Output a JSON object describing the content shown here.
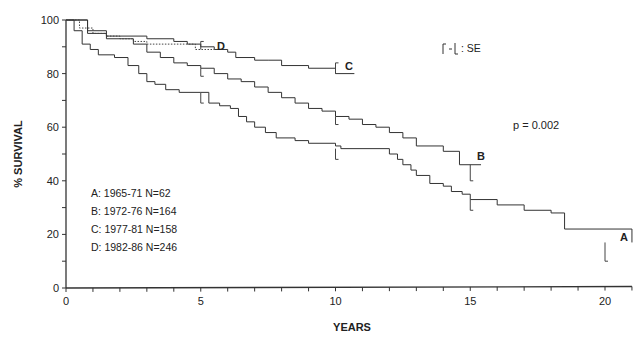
{
  "chart_data": {
    "type": "line",
    "subtype": "kaplan-meier step survival curves",
    "title": "",
    "xlabel": "YEARS",
    "ylabel": "% SURVIVAL",
    "xlim": [
      0,
      21
    ],
    "ylim": [
      0,
      100
    ],
    "xticks": [
      0,
      5,
      10,
      15,
      20
    ],
    "yticks": [
      0,
      20,
      40,
      60,
      80,
      100
    ],
    "grid": false,
    "legend_position": "inside lower-left",
    "legend": [
      "A: 1965-71 N=62",
      "B: 1972-76 N=164",
      "C: 1977-81 N=158",
      "D: 1982-86 N=246"
    ],
    "annotations": {
      "se_key": ": SE",
      "p_value": "p = 0.002"
    },
    "series": [
      {
        "name": "A",
        "label": "A: 1965-71 N=62",
        "style": "solid",
        "x": [
          0,
          0.3,
          0.6,
          0.9,
          1.2,
          1.8,
          2.3,
          2.7,
          3.0,
          3.3,
          3.7,
          4.2,
          5.0,
          5.3,
          5.7,
          6.1,
          6.4,
          6.7,
          7.0,
          7.4,
          7.8,
          8.5,
          9.0,
          10.0,
          10.2,
          11.8,
          12.0,
          12.3,
          12.5,
          12.8,
          13.0,
          13.5,
          14.0,
          14.3,
          14.7,
          15.0,
          16.0,
          17.0,
          18.0,
          18.5,
          21.0
        ],
        "y": [
          100,
          96,
          91,
          89,
          87,
          86,
          83,
          80,
          77,
          76,
          74,
          73,
          73,
          69,
          68,
          67,
          64,
          62,
          60,
          58,
          56,
          55,
          54,
          53,
          52,
          52,
          50,
          48,
          46,
          44,
          42,
          39,
          38,
          36,
          35,
          33,
          31,
          29,
          28,
          22,
          17
        ],
        "se_marks": [
          [
            5,
            73,
            69
          ],
          [
            10,
            52,
            48
          ],
          [
            15,
            33,
            29
          ],
          [
            20,
            17,
            10
          ]
        ],
        "end_label": "A"
      },
      {
        "name": "B",
        "label": "B: 1972-76 N=164",
        "style": "solid",
        "x": [
          0,
          0.8,
          1.5,
          2.5,
          3.0,
          3.5,
          4.0,
          4.5,
          5.0,
          5.5,
          6.0,
          6.5,
          7.0,
          7.5,
          8.0,
          8.5,
          9.0,
          9.5,
          10.0,
          10.5,
          11.0,
          11.5,
          12.0,
          12.5,
          13.0,
          14.0,
          14.6,
          15.4
        ],
        "y": [
          100,
          95,
          93,
          91,
          88,
          86,
          84,
          83,
          82,
          80,
          78,
          77,
          75,
          73,
          71,
          69,
          67,
          66,
          64,
          63,
          61,
          60,
          58,
          56,
          53,
          51,
          46,
          46
        ],
        "se_marks": [
          [
            5,
            82,
            79
          ],
          [
            10,
            64,
            61
          ],
          [
            15,
            46,
            40
          ]
        ],
        "end_label": "B"
      },
      {
        "name": "C",
        "label": "C: 1977-81 N=158",
        "style": "solid",
        "x": [
          0,
          0.8,
          1.5,
          2.0,
          3.0,
          4.0,
          4.5,
          5.0,
          5.5,
          6.0,
          6.3,
          7.0,
          7.5,
          8.0,
          9.0,
          10.0,
          10.7
        ],
        "y": [
          100,
          96,
          94,
          94,
          93,
          92,
          91,
          90,
          89,
          88,
          86,
          85,
          85,
          83,
          82,
          80,
          80
        ],
        "se_marks": [
          [
            10,
            80,
            84
          ]
        ],
        "end_label": "C"
      },
      {
        "name": "D",
        "label": "D: 1982-86 N=246",
        "style": "dotted",
        "x": [
          0,
          0.5,
          1.0,
          1.5,
          2.0,
          2.5,
          3.0,
          4.0,
          4.8,
          5.5
        ],
        "y": [
          100,
          97,
          95,
          94,
          93,
          92,
          91,
          91,
          89,
          89
        ],
        "se_marks": [
          [
            5,
            89,
            92
          ]
        ],
        "end_label": "D"
      }
    ]
  },
  "axes": {
    "y_label": "% SURVIVAL",
    "x_label": "YEARS",
    "y_tick_labels": [
      "0",
      "20",
      "40",
      "60",
      "80",
      "100"
    ],
    "x_tick_labels": [
      "0",
      "5",
      "10",
      "15",
      "20"
    ]
  },
  "legend": {
    "items": [
      "A: 1965-71 N=62",
      "B: 1972-76 N=164",
      "C: 1977-81 N=158",
      "D: 1982-86 N=246"
    ]
  },
  "annotations": {
    "se_key_text": ": SE",
    "p_value": "p = 0.002",
    "curve_labels": [
      "A",
      "B",
      "C",
      "D"
    ]
  }
}
